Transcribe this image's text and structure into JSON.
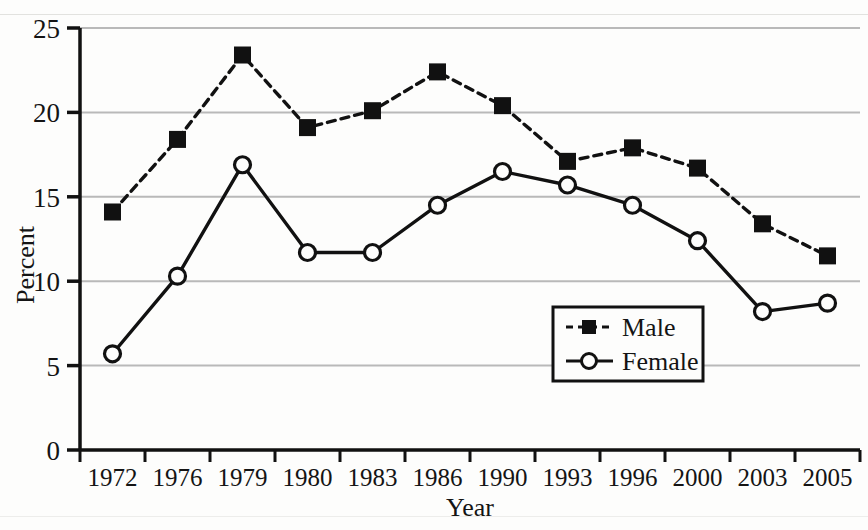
{
  "chart_data": {
    "type": "line",
    "title": "",
    "xlabel": "Year",
    "ylabel": "Percent",
    "categories": [
      "1972",
      "1976",
      "1979",
      "1980",
      "1983",
      "1986",
      "1990",
      "1993",
      "1996",
      "2000",
      "2003",
      "2005"
    ],
    "series": [
      {
        "name": "Male",
        "style": "dashed",
        "marker": "filled-square",
        "color": "#111111",
        "values": [
          14.1,
          18.4,
          23.4,
          19.1,
          20.1,
          22.4,
          20.4,
          17.1,
          17.9,
          16.7,
          13.4,
          11.5
        ]
      },
      {
        "name": "Female",
        "style": "solid",
        "marker": "open-circle",
        "color": "#111111",
        "values": [
          5.7,
          10.3,
          16.9,
          11.7,
          11.7,
          14.5,
          16.5,
          15.7,
          14.5,
          12.4,
          8.2,
          8.7
        ]
      }
    ],
    "ylim": [
      0,
      25
    ],
    "yticks": [
      0,
      5,
      10,
      15,
      20,
      25
    ],
    "ytick_labels": [
      "0",
      "5",
      "10",
      "15",
      "20",
      "25"
    ],
    "grid": true,
    "grid_color": "#b9b9b9",
    "legend_position": "bottom-right",
    "axis_color": "#111111",
    "background": "#fdfdfc"
  },
  "legend": {
    "entries": [
      {
        "label": "Male"
      },
      {
        "label": "Female"
      }
    ]
  },
  "axes": {
    "y_title": "Percent",
    "x_title": "Year"
  }
}
